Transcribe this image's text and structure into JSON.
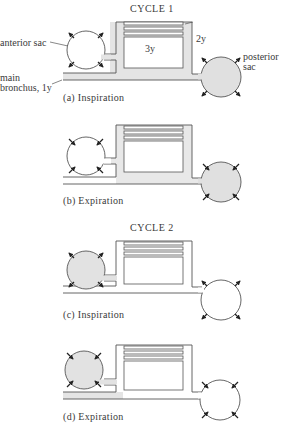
{
  "figure": {
    "cycle1_title": "CYCLE 1",
    "cycle2_title": "CYCLE 2",
    "labels": {
      "anterior_sac": "anterior sac",
      "posterior_sac_line1": "posterior",
      "posterior_sac_line2": "sac",
      "main_bronchus_line1": "main",
      "main_bronchus_line2": "bronchus, 1y",
      "parabronchi": "2y",
      "lung_block": "3y"
    },
    "panels": [
      {
        "id": "a",
        "caption": "(a) Inspiration",
        "anterior_filled": false,
        "posterior_filled": true,
        "bronchus_filled": true,
        "box_frame_filled": true,
        "anterior_arrows": "outward",
        "posterior_arrows": "outward"
      },
      {
        "id": "b",
        "caption": "(b) Expiration",
        "anterior_filled": false,
        "posterior_filled": true,
        "bronchus_filled": false,
        "box_frame_filled": true,
        "anterior_arrows": "inward",
        "posterior_arrows": "inward"
      },
      {
        "id": "c",
        "caption": "(c) Inspiration",
        "anterior_filled": true,
        "posterior_filled": false,
        "bronchus_filled": false,
        "box_frame_filled": false,
        "anterior_arrows": "outward",
        "posterior_arrows": "outward"
      },
      {
        "id": "d",
        "caption": "(d) Expiration",
        "anterior_filled": true,
        "posterior_filled": false,
        "bronchus_filled": true,
        "box_frame_filled": false,
        "anterior_arrows": "inward",
        "posterior_arrows": "inward"
      }
    ],
    "colors": {
      "line": "#555555",
      "fill": "#e2e2e2",
      "arrow": "#222222"
    }
  }
}
